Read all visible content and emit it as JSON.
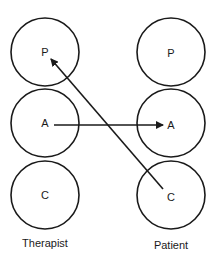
{
  "diagram": {
    "type": "transactional-analysis",
    "columns": [
      {
        "id": "therapist",
        "caption": "Therapist",
        "states": [
          {
            "id": "P",
            "label": "P"
          },
          {
            "id": "A",
            "label": "A"
          },
          {
            "id": "C",
            "label": "C"
          }
        ]
      },
      {
        "id": "patient",
        "caption": "Patient",
        "states": [
          {
            "id": "P",
            "label": "P"
          },
          {
            "id": "A",
            "label": "A"
          },
          {
            "id": "C",
            "label": "C"
          }
        ]
      }
    ],
    "arrows": [
      {
        "from": "therapist.A",
        "to": "patient.A"
      },
      {
        "from": "patient.C",
        "to": "therapist.P"
      }
    ],
    "colors": {
      "stroke": "#1a1a1a",
      "background": "#ffffff"
    }
  }
}
